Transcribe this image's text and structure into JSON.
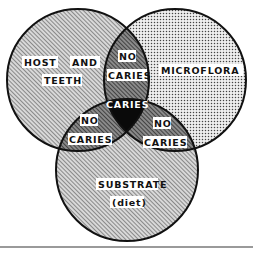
{
  "diagram": {
    "type": "venn",
    "circles": [
      {
        "id": "host",
        "label_line1": "HOST",
        "label_line2": "AND",
        "label_line3": "TEETH",
        "pattern": "diagonal-hatch"
      },
      {
        "id": "microflora",
        "label": "MICROFLORA",
        "pattern": "dot-screen"
      },
      {
        "id": "substrate",
        "label_line1": "SUBSTRATE",
        "label_line2": "(diet)",
        "pattern": "diagonal-hatch"
      }
    ],
    "intersections": {
      "host_microflora": {
        "line1": "NO",
        "line2": "CARIES"
      },
      "host_substrate": {
        "line1": "NO",
        "line2": "CARIES"
      },
      "microflora_substrate": {
        "line1": "NO",
        "line2": "CARIES"
      },
      "all_three": {
        "label": "CARIES"
      }
    },
    "colors": {
      "outline": "#111111",
      "center_fill": "#0a0a0a",
      "label_bg": "#ffffff",
      "label_text": "#111111",
      "center_label_text": "#ffffff"
    }
  }
}
